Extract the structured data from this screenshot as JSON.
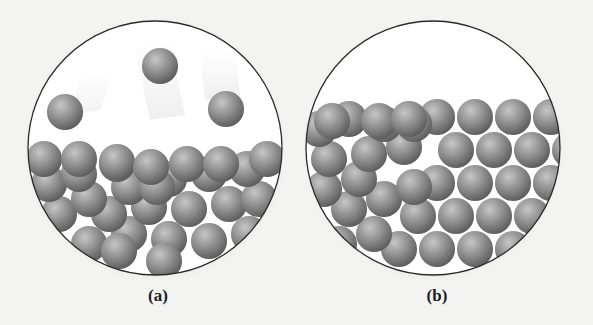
{
  "figure": {
    "panels": [
      {
        "id": "a",
        "label": "(a)",
        "description": "Liquid: loosely packed spheres with some escaping into the gas phase above"
      },
      {
        "id": "b",
        "label": "(b)",
        "description": "Solid: spheres in an ordered, tightly packed arrangement"
      }
    ],
    "colors": {
      "background": "#f3f3f2",
      "circle_fill": "#ffffff",
      "circle_border": "#2a2a2a",
      "sphere_base": "#8a8a8a",
      "sphere_highlight": "#c8c8c8",
      "sphere_shadow": "#5e5e5e"
    }
  }
}
